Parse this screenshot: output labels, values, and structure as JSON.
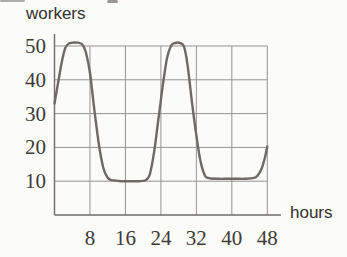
{
  "chart_data": {
    "type": "line",
    "title": "",
    "ylabel": "workers",
    "xlabel": "hours",
    "x_ticks": [
      8,
      16,
      24,
      32,
      40,
      48
    ],
    "y_ticks": [
      10,
      20,
      30,
      40,
      50
    ],
    "xlim": [
      0,
      48
    ],
    "ylim": [
      0,
      55
    ],
    "grid": true,
    "legend": false,
    "series": [
      {
        "name": "workers-over-hours",
        "points": [
          [
            0,
            33
          ],
          [
            0.8,
            39
          ],
          [
            1.6,
            45
          ],
          [
            2.4,
            49.3
          ],
          [
            3.2,
            50.7
          ],
          [
            4.2,
            51
          ],
          [
            5.3,
            51
          ],
          [
            6.3,
            50.4
          ],
          [
            7.1,
            48
          ],
          [
            8,
            42
          ],
          [
            9,
            31
          ],
          [
            10,
            21
          ],
          [
            11,
            14
          ],
          [
            12,
            11
          ],
          [
            13,
            10.3
          ],
          [
            15,
            10
          ],
          [
            17,
            10
          ],
          [
            19,
            10
          ],
          [
            20.5,
            10.3
          ],
          [
            21.5,
            12
          ],
          [
            22.5,
            19
          ],
          [
            23.5,
            29
          ],
          [
            24.5,
            39
          ],
          [
            25.4,
            46.5
          ],
          [
            26.3,
            50.1
          ],
          [
            27.2,
            50.9
          ],
          [
            28.3,
            50.9
          ],
          [
            29.2,
            49.8
          ],
          [
            30,
            44.5
          ],
          [
            31,
            33.5
          ],
          [
            32,
            23.5
          ],
          [
            33,
            15.5
          ],
          [
            34,
            11.5
          ],
          [
            35,
            10.9
          ],
          [
            37,
            10.7
          ],
          [
            39,
            10.7
          ],
          [
            41,
            10.7
          ],
          [
            43,
            10.7
          ],
          [
            44.8,
            10.9
          ],
          [
            45.8,
            11.6
          ],
          [
            46.8,
            14
          ],
          [
            47.5,
            17.2
          ],
          [
            48,
            20.3
          ]
        ]
      }
    ],
    "colors": {
      "curve": "#6e6963",
      "grid": "#969390",
      "axis": "#6f6c68",
      "tick_text": "#3d3a36",
      "label_text": "#33312e",
      "background": "#fbfbf8",
      "artifact": "#6f6b66"
    }
  }
}
